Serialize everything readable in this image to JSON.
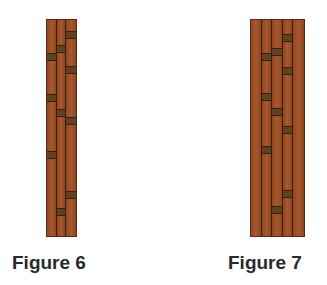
{
  "figures": [
    {
      "label": "Figure 6",
      "x": 46,
      "y": 19,
      "width": 31,
      "height": 218,
      "label_x": 12,
      "label_y": 252,
      "columns": [
        {
          "tiles": [
            33,
            74,
            131
          ]
        },
        {
          "tiles": [
            25,
            89,
            188
          ]
        },
        {
          "tiles": [
            11,
            46,
            97,
            171
          ]
        }
      ]
    },
    {
      "label": "Figure 7",
      "x": 250,
      "y": 19,
      "width": 55,
      "height": 218,
      "label_x": 228,
      "label_y": 252,
      "columns": [
        {
          "tiles": []
        },
        {
          "tiles": [
            33,
            73,
            126
          ]
        },
        {
          "tiles": [
            28,
            88,
            186
          ]
        },
        {
          "tiles": [
            14,
            47,
            106,
            170
          ]
        },
        {
          "tiles": []
        }
      ]
    }
  ],
  "colors": {
    "wood": "#9a4e26",
    "grain_line": "#3e1c0c",
    "dark_tile": "#5c4322",
    "label_text": "#2a2a2a"
  },
  "tile_height": 8
}
